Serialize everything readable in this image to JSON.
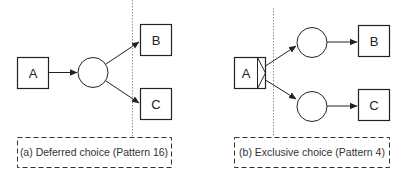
{
  "diagram_a": {
    "caption": "(a)  Deferred choice (Pattern 16)",
    "nodes": {
      "a": "A",
      "b": "B",
      "c": "C"
    }
  },
  "diagram_b": {
    "caption": "(b)  Exclusive choice (Pattern 4)",
    "nodes": {
      "a": "A",
      "b": "B",
      "c": "C"
    }
  },
  "colors": {
    "stroke": "#222222",
    "dotted": "#777777",
    "background": "#ffffff"
  }
}
